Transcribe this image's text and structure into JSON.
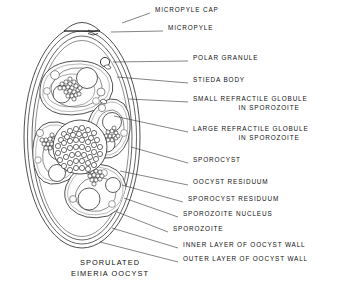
{
  "figure": {
    "caption_line1": "SPORULATED",
    "caption_line2": "EIMERIA OOCYST",
    "line_color": "#222222",
    "fill_color": "#ffffff",
    "stipple_color": "#1a1a1a",
    "background": "#ffffff"
  },
  "labels": [
    {
      "id": "micropyle-cap",
      "text": "MICROPYLE CAP",
      "text2": "",
      "x": 155,
      "y": 10,
      "leader": [
        [
          150,
          13
        ],
        [
          122,
          23
        ]
      ]
    },
    {
      "id": "micropyle",
      "text": "MICROPYLE",
      "text2": "",
      "x": 168,
      "y": 28,
      "leader": [
        [
          163,
          31
        ],
        [
          111,
          32
        ]
      ]
    },
    {
      "id": "polar-granule",
      "text": "POLAR GRANULE",
      "text2": "",
      "x": 193,
      "y": 58,
      "leader": [
        [
          188,
          61
        ],
        [
          113,
          62
        ]
      ]
    },
    {
      "id": "stieda-body",
      "text": "STIEDA BODY",
      "text2": "",
      "x": 193,
      "y": 80,
      "leader": [
        [
          188,
          83
        ],
        [
          117,
          77
        ]
      ]
    },
    {
      "id": "small-refractile-globule",
      "text": "SMALL REFRACTILE GLOBULE",
      "text2": "IN SPOROZOITE",
      "x": 193,
      "y": 99,
      "leader": [
        [
          188,
          102
        ],
        [
          129,
          99
        ]
      ]
    },
    {
      "id": "large-refractile-globule",
      "text": "LARGE REFRACTILE GLOBULE",
      "text2": "IN SPOROZOITE",
      "x": 193,
      "y": 129,
      "leader": [
        [
          188,
          132
        ],
        [
          114,
          116
        ]
      ]
    },
    {
      "id": "sporocyst",
      "text": "SPOROCYST",
      "text2": "",
      "x": 193,
      "y": 160,
      "leader": [
        [
          188,
          163
        ],
        [
          131,
          147
        ]
      ]
    },
    {
      "id": "oocyst-residuum",
      "text": "OOCYST RESIDUUM",
      "text2": "",
      "x": 193,
      "y": 182,
      "leader": [
        [
          188,
          185
        ],
        [
          120,
          171
        ]
      ]
    },
    {
      "id": "sporocyst-residuum",
      "text": "SPOROCYST RESIDUUM",
      "text2": "",
      "x": 188,
      "y": 199,
      "leader": [
        [
          183,
          202
        ],
        [
          122,
          185
        ]
      ]
    },
    {
      "id": "sporozoite-nucleus",
      "text": "SPOROZOITE NUCLEUS",
      "text2": "",
      "x": 183,
      "y": 214,
      "leader": [
        [
          178,
          217
        ],
        [
          124,
          198
        ]
      ]
    },
    {
      "id": "sporozoite",
      "text": "SPOROZOITE",
      "text2": "",
      "x": 173,
      "y": 229,
      "leader": [
        [
          168,
          232
        ],
        [
          117,
          212
        ]
      ]
    },
    {
      "id": "inner-layer-oocyst-wall",
      "text": "INNER LAYER OF OOCYST WALL",
      "text2": "",
      "x": 183,
      "y": 245,
      "leader": [
        [
          178,
          248
        ],
        [
          112,
          228
        ]
      ]
    },
    {
      "id": "outer-layer-oocyst-wall",
      "text": "OUTER LAYER OF OOCYST WALL",
      "text2": "",
      "x": 183,
      "y": 259,
      "leader": [
        [
          178,
          262
        ],
        [
          100,
          242
        ]
      ]
    }
  ],
  "caption": {
    "x": 110,
    "y": 262
  },
  "structures": {
    "oocyst_outer_wall": "outer ellipse",
    "oocyst_inner_wall": "inner ellipse",
    "micropyle_cap": "dome at apex",
    "polar_granule": "small circle below micropyle",
    "sporocyst_count": 4,
    "sporozoites_per_sporocyst": 2,
    "oocyst_residuum": "large central granular mass"
  }
}
